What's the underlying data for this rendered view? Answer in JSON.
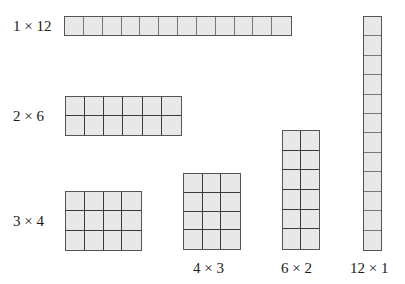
{
  "arrays": [
    {
      "label": "1 × 12",
      "rows": 1,
      "cols": 12,
      "x": 64,
      "y": 16,
      "w": 228,
      "h": 20,
      "label_x": 13,
      "label_y": 19,
      "style": "light"
    },
    {
      "label": "2 × 6",
      "rows": 2,
      "cols": 6,
      "x": 65,
      "y": 96,
      "w": 117,
      "h": 40,
      "label_x": 13,
      "label_y": 109,
      "style": "dark"
    },
    {
      "label": "3 × 4",
      "rows": 3,
      "cols": 4,
      "x": 65,
      "y": 191,
      "w": 77,
      "h": 60,
      "label_x": 13,
      "label_y": 214,
      "style": "dark"
    },
    {
      "label": "4 × 3",
      "rows": 4,
      "cols": 3,
      "x": 183,
      "y": 173,
      "w": 58,
      "h": 77,
      "label_x": 193,
      "label_y": 261,
      "style": "dark"
    },
    {
      "label": "6 × 2",
      "rows": 6,
      "cols": 2,
      "x": 282,
      "y": 130,
      "w": 38,
      "h": 120,
      "label_x": 281,
      "label_y": 261,
      "style": "dark"
    },
    {
      "label": "12 × 1",
      "rows": 12,
      "cols": 1,
      "x": 363,
      "y": 16,
      "w": 19,
      "h": 235,
      "label_x": 350,
      "label_y": 261,
      "style": "light"
    }
  ],
  "colors": {
    "cell_fill": "#e8e8e8",
    "grid_line": "#3a3a3a",
    "background": "#ffffff"
  }
}
